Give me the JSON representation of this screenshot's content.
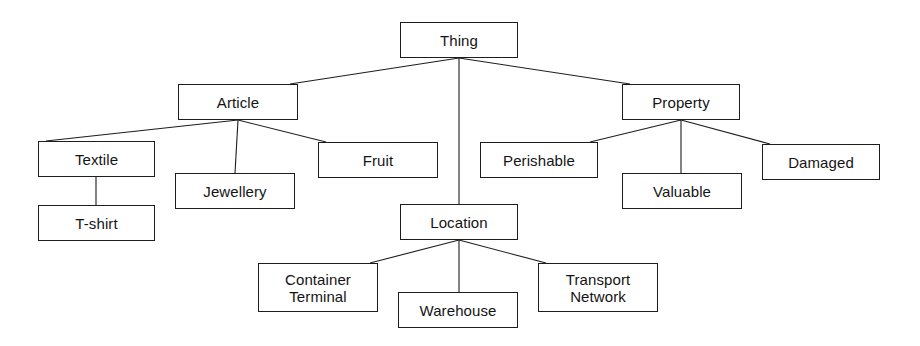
{
  "diagram": {
    "type": "tree-hierarchy",
    "background_color": "#ffffff",
    "line_color": "#1d1d1d",
    "text_color": "#141414",
    "nodes": [
      {
        "id": "thing",
        "label": "Thing",
        "x": 400,
        "y": 22,
        "w": 118,
        "h": 36
      },
      {
        "id": "article",
        "label": "Article",
        "x": 178,
        "y": 84,
        "w": 120,
        "h": 36
      },
      {
        "id": "property",
        "label": "Property",
        "x": 622,
        "y": 84,
        "w": 118,
        "h": 36
      },
      {
        "id": "textile",
        "label": "Textile",
        "x": 38,
        "y": 141,
        "w": 117,
        "h": 36
      },
      {
        "id": "jewellery",
        "label": "Jewellery",
        "x": 175,
        "y": 173,
        "w": 120,
        "h": 36
      },
      {
        "id": "fruit",
        "label": "Fruit",
        "x": 318,
        "y": 142,
        "w": 120,
        "h": 36
      },
      {
        "id": "perishable",
        "label": "Perishable",
        "x": 480,
        "y": 142,
        "w": 118,
        "h": 36
      },
      {
        "id": "valuable",
        "label": "Valuable",
        "x": 622,
        "y": 173,
        "w": 120,
        "h": 36
      },
      {
        "id": "damaged",
        "label": "Damaged",
        "x": 762,
        "y": 144,
        "w": 118,
        "h": 36
      },
      {
        "id": "tshirt",
        "label": "T-shirt",
        "x": 38,
        "y": 205,
        "w": 117,
        "h": 36
      },
      {
        "id": "location",
        "label": "Location",
        "x": 400,
        "y": 204,
        "w": 118,
        "h": 36
      },
      {
        "id": "container-terminal",
        "label": "Container\nTerminal",
        "x": 258,
        "y": 263,
        "w": 120,
        "h": 49
      },
      {
        "id": "warehouse",
        "label": "Warehouse",
        "x": 398,
        "y": 292,
        "w": 120,
        "h": 36
      },
      {
        "id": "transport-network",
        "label": "Transport\nNetwork",
        "x": 538,
        "y": 263,
        "w": 120,
        "h": 49
      }
    ],
    "edges": [
      {
        "from": "thing",
        "to": "article",
        "x1": 459,
        "y1": 58,
        "x2": 290,
        "y2": 84
      },
      {
        "from": "thing",
        "to": "location",
        "x1": 459,
        "y1": 58,
        "x2": 459,
        "y2": 204
      },
      {
        "from": "thing",
        "to": "property",
        "x1": 459,
        "y1": 58,
        "x2": 630,
        "y2": 84
      },
      {
        "from": "article",
        "to": "textile",
        "x1": 238,
        "y1": 120,
        "x2": 46,
        "y2": 141
      },
      {
        "from": "article",
        "to": "jewellery",
        "x1": 238,
        "y1": 120,
        "x2": 235,
        "y2": 173
      },
      {
        "from": "article",
        "to": "fruit",
        "x1": 238,
        "y1": 120,
        "x2": 326,
        "y2": 142
      },
      {
        "from": "textile",
        "to": "tshirt",
        "x1": 96,
        "y1": 177,
        "x2": 96,
        "y2": 205
      },
      {
        "from": "property",
        "to": "perishable",
        "x1": 681,
        "y1": 120,
        "x2": 590,
        "y2": 142
      },
      {
        "from": "property",
        "to": "valuable",
        "x1": 681,
        "y1": 120,
        "x2": 681,
        "y2": 173
      },
      {
        "from": "property",
        "to": "damaged",
        "x1": 681,
        "y1": 120,
        "x2": 770,
        "y2": 144
      },
      {
        "from": "location",
        "to": "container-terminal",
        "x1": 459,
        "y1": 240,
        "x2": 370,
        "y2": 263
      },
      {
        "from": "location",
        "to": "warehouse",
        "x1": 459,
        "y1": 240,
        "x2": 459,
        "y2": 292
      },
      {
        "from": "location",
        "to": "transport-network",
        "x1": 459,
        "y1": 240,
        "x2": 546,
        "y2": 263
      }
    ]
  }
}
